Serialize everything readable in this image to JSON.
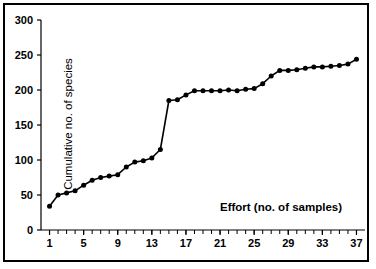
{
  "chart_data": {
    "type": "line",
    "title": "",
    "xlabel": "Effort (no. of samples)",
    "ylabel": "Cumulative no. of species",
    "xlim": [
      0,
      38
    ],
    "ylim": [
      0,
      300
    ],
    "grid": false,
    "legend": "none",
    "marker": "filled-circle",
    "series_color": "#000000",
    "xticks": [
      1,
      5,
      9,
      13,
      17,
      21,
      25,
      29,
      33,
      37
    ],
    "xtick_labels": [
      "1",
      "5",
      "9",
      "13",
      "17",
      "21",
      "25",
      "29",
      "33",
      "37"
    ],
    "xtick_minor_step": 1,
    "yticks": [
      0,
      50,
      100,
      150,
      200,
      250,
      300
    ],
    "ytick_labels": [
      "0",
      "50",
      "100",
      "150",
      "200",
      "250",
      "300"
    ],
    "x": [
      1,
      2,
      3,
      4,
      5,
      6,
      7,
      8,
      9,
      10,
      11,
      12,
      13,
      14,
      15,
      16,
      17,
      18,
      19,
      20,
      21,
      22,
      23,
      24,
      25,
      26,
      27,
      28,
      29,
      30,
      31,
      32,
      33,
      34,
      35,
      36,
      37
    ],
    "values": [
      34,
      50,
      53,
      56,
      64,
      71,
      75,
      77,
      79,
      90,
      97,
      99,
      103,
      115,
      185,
      186,
      193,
      199,
      199,
      199,
      199,
      200,
      199,
      201,
      202,
      209,
      220,
      228,
      228,
      229,
      231,
      233,
      233,
      234,
      235,
      237,
      244
    ],
    "series": [
      {
        "name": "Cumulative species",
        "values": [
          34,
          50,
          53,
          56,
          64,
          71,
          75,
          77,
          79,
          90,
          97,
          99,
          103,
          115,
          185,
          186,
          193,
          199,
          199,
          199,
          199,
          200,
          199,
          201,
          202,
          209,
          220,
          228,
          228,
          229,
          231,
          233,
          233,
          234,
          235,
          237,
          244
        ]
      }
    ]
  },
  "figure": {
    "border_color": "#000000",
    "background": "#ffffff"
  }
}
